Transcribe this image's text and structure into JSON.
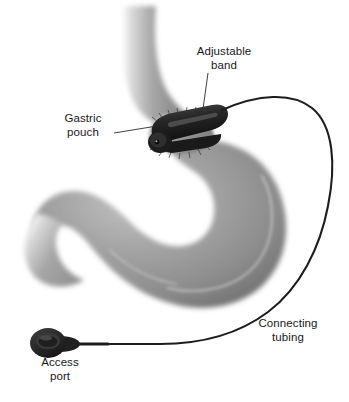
{
  "figure": {
    "background_color": "#ffffff",
    "width": 349,
    "height": 402
  },
  "labels": {
    "adjustable_band": "Adjustable\nband",
    "gastric_pouch": "Gastric\npouch",
    "connecting_tubing": "Connecting\ntubing",
    "access_port": "Access\nport"
  },
  "colors": {
    "text": "#17171a",
    "leader_line": "#2b2b2b",
    "organ_light": "#d9d9d9",
    "organ_mid": "#9b9b9b",
    "organ_dark": "#6e6e6e",
    "organ_highlight": "#c9c9c9",
    "device_dark": "#2a2a2a",
    "device_black": "#141414",
    "tubing": "#1d1d1d"
  },
  "parts": [
    {
      "name": "esophagus",
      "description": "Gray tube descending from top center curving right into the gastric pouch"
    },
    {
      "name": "gastric-pouch",
      "description": "Small upper stomach pouch above the band"
    },
    {
      "name": "stomach-body",
      "description": "Large J-shaped stomach below the band"
    },
    {
      "name": "adjustable-band",
      "description": "Dark inflatable cuff encircling the upper stomach with buckle at lower left"
    },
    {
      "name": "connecting-tubing",
      "description": "Thin dark tube arcing from the band up right, around the stomach, down to the access port"
    },
    {
      "name": "access-port",
      "description": "Dark teardrop-shaped subcutaneous injection port at lower left"
    }
  ]
}
